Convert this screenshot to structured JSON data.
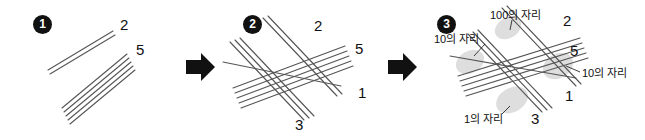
{
  "figure": {
    "width": 645,
    "height": 140,
    "background": "#ffffff",
    "line_color": "#555555",
    "ink_color": "#111111",
    "shade_color": "#d9d9d9"
  },
  "steps": [
    {
      "badge": "1",
      "caption": "draw-line-groups",
      "digits": [
        {
          "value": "2",
          "name": "digit-2",
          "group_count": 2
        },
        {
          "value": "5",
          "name": "digit-5",
          "group_count": 5
        }
      ]
    },
    {
      "badge": "2",
      "caption": "cross-line-groups",
      "digits": [
        {
          "value": "2",
          "name": "digit-2",
          "group_count": 2
        },
        {
          "value": "5",
          "name": "digit-5",
          "group_count": 5
        },
        {
          "value": "1",
          "name": "digit-1",
          "group_count": 1
        },
        {
          "value": "3",
          "name": "digit-3",
          "group_count": 3
        }
      ]
    },
    {
      "badge": "3",
      "caption": "mark-place-values",
      "digits": [
        {
          "value": "2",
          "name": "digit-2",
          "group_count": 2
        },
        {
          "value": "5",
          "name": "digit-5",
          "group_count": 5
        },
        {
          "value": "1",
          "name": "digit-1",
          "group_count": 1
        },
        {
          "value": "3",
          "name": "digit-3",
          "group_count": 3
        }
      ],
      "place_labels": [
        {
          "text": "100의 자리",
          "name": "place-label-hundreds"
        },
        {
          "text": "10의 자리",
          "name": "place-label-tens-left"
        },
        {
          "text": "10의 자리",
          "name": "place-label-tens-right"
        },
        {
          "text": "1의 자리",
          "name": "place-label-ones"
        }
      ]
    }
  ],
  "arrows": [
    {
      "name": "arrow-step-1-to-2",
      "glyph": "➡"
    },
    {
      "name": "arrow-step-2-to-3",
      "glyph": "➡"
    }
  ]
}
